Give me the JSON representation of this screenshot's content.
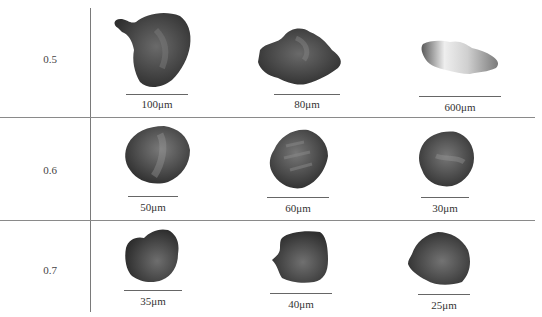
{
  "figure": {
    "rows": [
      {
        "label": "0.5",
        "items": [
          {
            "scale": "100μm",
            "tone": "dark",
            "shape": "blob-knob"
          },
          {
            "scale": "80μm",
            "tone": "dark",
            "shape": "flat-irregular"
          },
          {
            "scale": "600μm",
            "tone": "light",
            "shape": "elongated"
          }
        ]
      },
      {
        "label": "0.6",
        "items": [
          {
            "scale": "50μm",
            "tone": "dark",
            "shape": "ovoid"
          },
          {
            "scale": "60μm",
            "tone": "dark",
            "shape": "ovoid-tilted"
          },
          {
            "scale": "30μm",
            "tone": "dark",
            "shape": "round-rough"
          }
        ]
      },
      {
        "label": "0.7",
        "items": [
          {
            "scale": "35μm",
            "tone": "dark",
            "shape": "angular"
          },
          {
            "scale": "40μm",
            "tone": "dark",
            "shape": "square"
          },
          {
            "scale": "25μm",
            "tone": "dark",
            "shape": "polygon-round"
          }
        ]
      }
    ],
    "colors": {
      "particle_dark": "#4a4a4a",
      "particle_light": "#d8d8d8",
      "rule": "#7a7a7a"
    }
  }
}
